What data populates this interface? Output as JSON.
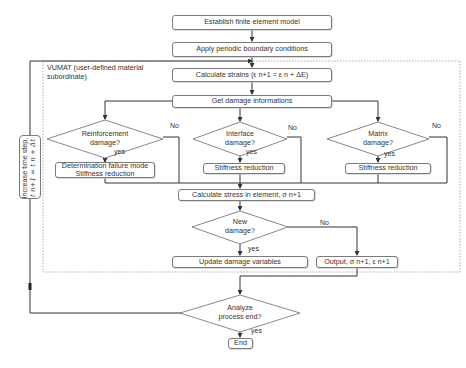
{
  "diagram": {
    "type": "flowchart",
    "region_label": "VUMAT (user-defined material subordinate)",
    "nodes": {
      "establish": "Establish finite element model",
      "apply_bc": "Apply periodic boundary conditions",
      "calc_strains": "Calculate strains (ε n+1 = ε n + ΔE)",
      "get_damage": "Get damage informations",
      "reinforcement_decision_line1": "Reinforcement",
      "reinforcement_decision_line2": "damage?",
      "interface_decision_line1": "Interface",
      "interface_decision_line2": "damage?",
      "matrix_decision_line1": "Matrix",
      "matrix_decision_line2": "damage?",
      "reinforcement_action_line1": "Determination failure mode",
      "reinforcement_action_line2": "Stiffness reduction",
      "interface_action": "Stiffness reduction",
      "matrix_action": "Stiffness reduction",
      "calc_stress": "Calculate stress in element, σ n+1",
      "new_damage_line1": "New",
      "new_damage_line2": "damage?",
      "update_damage": "Update damage variables",
      "output": "Output, σ n+1, ε n+1",
      "analyze_line1": "Analyze",
      "analyze_line2": "process end?",
      "end": "End",
      "time_step_line1": "Increase time step,",
      "time_step_line2": "t n+1 = t n + Δt"
    },
    "edge_labels": {
      "yes": "yes",
      "no": "No"
    }
  }
}
